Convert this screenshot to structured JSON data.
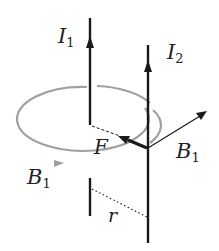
{
  "diagram": {
    "labels": {
      "current1": "I",
      "current1_sub": "1",
      "current2": "I",
      "current2_sub": "2",
      "field_left": "B",
      "field_left_sub": "1",
      "field_right": "B",
      "field_right_sub": "1",
      "force": "F",
      "distance": "r"
    },
    "colors": {
      "wire": "#1a1a1a",
      "field_loop": "#a0a0a0",
      "text": "#222222"
    }
  }
}
